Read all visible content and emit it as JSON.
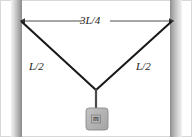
{
  "figure": {
    "background_color": "#ffffff",
    "border_color": "#d8d8d8",
    "width": 192,
    "height": 137
  },
  "labels": {
    "span": "3L/4",
    "cord_left": "L/2",
    "cord_right": "L/2",
    "mass": "m"
  },
  "colors": {
    "cord": "#1a1a1a",
    "dimension_line": "#555555",
    "wall_light": "#efefef",
    "wall_mid": "#b9b9b9",
    "wall_dark": "#8e8e8e",
    "block_fill": "#b4b4b4",
    "block_stroke": "#8a8a8a",
    "text": "#1a1a1a"
  },
  "geometry": {
    "wall_left": {
      "x": 11,
      "y": 0,
      "width": 11,
      "height": 137
    },
    "wall_right": {
      "x": 170,
      "y": 0,
      "width": 12,
      "height": 137
    },
    "dimension_line": {
      "x1": 23,
      "x2": 171,
      "y": 21
    },
    "cord_left": {
      "x1": 22,
      "y1": 22,
      "x2": 96,
      "y2": 90
    },
    "cord_right": {
      "x1": 171,
      "y1": 22,
      "x2": 96,
      "y2": 90
    },
    "cord_vertical": {
      "x": 96,
      "y1": 90,
      "y2": 109
    },
    "block": {
      "x": 86,
      "y": 108,
      "width": 22,
      "height": 22,
      "radius": 3
    },
    "label_span_pos": {
      "x": 96,
      "y": 20
    },
    "label_cord_left_pos": {
      "x": 33,
      "y": 67
    },
    "label_cord_right_pos": {
      "x": 138,
      "y": 67
    },
    "label_mass_pos": {
      "x": 97,
      "y": 120
    }
  }
}
